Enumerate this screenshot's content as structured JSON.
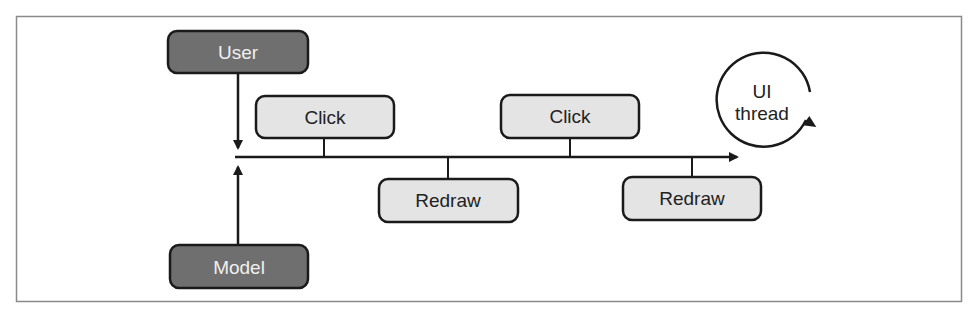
{
  "diagram": {
    "actors": {
      "user": {
        "label": "User"
      },
      "model": {
        "label": "Model"
      }
    },
    "events": [
      {
        "label": "Click",
        "position": "above"
      },
      {
        "label": "Redraw",
        "position": "below"
      },
      {
        "label": "Click",
        "position": "above"
      },
      {
        "label": "Redraw",
        "position": "below"
      }
    ],
    "thread": {
      "line1": "UI",
      "line2": "thread"
    }
  },
  "colors": {
    "actor_fill": "#6f6f6f",
    "event_fill": "#e4e4e4",
    "stroke": "#1a1a1a",
    "frame": "#8a8a8a"
  }
}
